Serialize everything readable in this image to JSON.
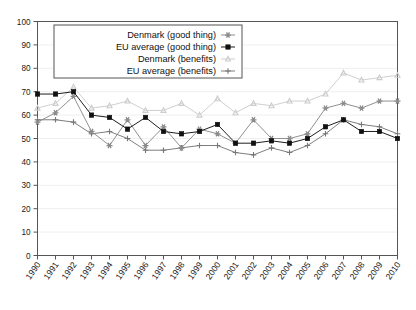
{
  "chart_data": {
    "type": "line",
    "title": "",
    "subtitle": "",
    "xlabel": "",
    "ylabel": "",
    "xlim": [
      1990,
      2010
    ],
    "ylim": [
      0,
      100
    ],
    "ytick_step": 10,
    "grid": true,
    "grid_axis": "y",
    "legend_position": "top-left-inside",
    "categories": [
      "1990",
      "1991",
      "1992",
      "1993",
      "1994",
      "1995",
      "1996",
      "1997",
      "1998",
      "1999",
      "2000",
      "2001",
      "2002",
      "2003",
      "2004",
      "2005",
      "2006",
      "2007",
      "2008",
      "2009",
      "2010"
    ],
    "yticks": [
      "0",
      "10",
      "20",
      "30",
      "40",
      "50",
      "60",
      "70",
      "80",
      "90",
      "100"
    ],
    "series": [
      {
        "name": "Denmark (good thing)",
        "marker": "asterisk",
        "color": "#8a8a8a",
        "values": [
          57,
          61,
          68,
          53,
          47,
          58,
          47,
          55,
          46,
          54,
          52,
          48,
          58,
          50,
          50,
          52,
          63,
          65,
          63,
          66,
          66
        ]
      },
      {
        "name": "EU average (good thing)",
        "marker": "square",
        "color": "#111111",
        "values": [
          69,
          69,
          70,
          60,
          59,
          54,
          59,
          53,
          52,
          53,
          56,
          48,
          48,
          49,
          48,
          50,
          55,
          58,
          53,
          53,
          50
        ]
      },
      {
        "name": "Denmark (benefits)",
        "marker": "triangle",
        "color": "#cccccc",
        "values": [
          63,
          65,
          72,
          63,
          64,
          66,
          62,
          62,
          65,
          60,
          67,
          61,
          65,
          64,
          66,
          66,
          69,
          78,
          75,
          76,
          77
        ]
      },
      {
        "name": "EU average (benefits)",
        "marker": "plus",
        "color": "#777777",
        "values": [
          58,
          58,
          57,
          52,
          53,
          50,
          45,
          45,
          46,
          47,
          47,
          44,
          43,
          46,
          44,
          47,
          52,
          58,
          56,
          55,
          52
        ]
      }
    ]
  },
  "legend": {
    "entries": [
      {
        "label": "Denmark (good thing)"
      },
      {
        "label": "EU average (good thing)"
      },
      {
        "label": "Denmark (benefits)"
      },
      {
        "label": "EU average (benefits)"
      }
    ]
  },
  "axes": {
    "y_labels": [
      "100",
      "90",
      "80",
      "70",
      "60",
      "50",
      "40",
      "30",
      "20",
      "10",
      "0"
    ],
    "x_labels": [
      "1990",
      "1991",
      "1992",
      "1993",
      "1994",
      "1995",
      "1996",
      "1997",
      "1998",
      "1999",
      "2000",
      "2001",
      "2002",
      "2003",
      "2004",
      "2005",
      "2006",
      "2007",
      "2008",
      "2009",
      "2010"
    ]
  },
  "colors": {
    "frame": "#555555",
    "grid": "#eeeeee",
    "denmark_good": "#8a8a8a",
    "eu_good": "#111111",
    "denmark_benefits": "#cccccc",
    "eu_benefits": "#777777"
  }
}
